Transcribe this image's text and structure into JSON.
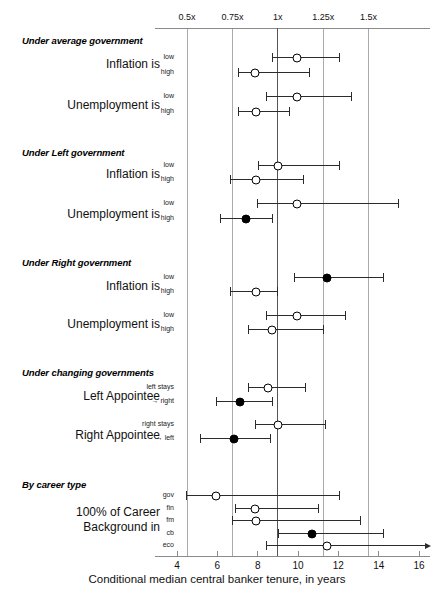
{
  "chart_data": {
    "type": "scatter",
    "title": "",
    "xlabel": "Conditional median central banker tenure, in years",
    "ylabel": "",
    "xlim": [
      3,
      16.6
    ],
    "grid": true,
    "bottom_axis": {
      "ticks": [
        4,
        6,
        8,
        10,
        12,
        14,
        16
      ],
      "tick_labels": [
        "4",
        "6",
        "8",
        "10",
        "12",
        "14",
        "16"
      ]
    },
    "top_axis": {
      "ticks": [
        4.5,
        6.75,
        9,
        11.25,
        13.5
      ],
      "tick_labels": [
        "0.5x",
        "0.75x",
        "1x",
        "1.25x",
        "1.5x"
      ],
      "reference_value": 9,
      "reference_label": "1x"
    },
    "legend": {
      "hollow_marker": "not significant",
      "filled_marker": "significant"
    },
    "groups": [
      {
        "title": "Under average government",
        "rows": [
          {
            "label": "Inflation is",
            "sublabels": [
              "low",
              "high"
            ],
            "estimates": [
              {
                "sub": "low",
                "value": 9.95,
                "low": 8.73,
                "high": 12.01,
                "filled": false,
                "right_truncated": false
              },
              {
                "sub": "high",
                "value": 7.87,
                "low": 7.02,
                "high": 10.55,
                "filled": false,
                "right_truncated": false
              }
            ]
          },
          {
            "label": "Unemployment is",
            "sublabels": [
              "low",
              "high"
            ],
            "estimates": [
              {
                "sub": "low",
                "value": 9.95,
                "low": 8.43,
                "high": 12.65,
                "filled": false,
                "right_truncated": false
              },
              {
                "sub": "high",
                "value": 7.92,
                "low": 7.02,
                "high": 9.55,
                "filled": false,
                "right_truncated": false
              }
            ]
          }
        ]
      },
      {
        "title": "Under Left government",
        "rows": [
          {
            "label": "Inflation is",
            "sublabels": [
              "low",
              "high"
            ],
            "estimates": [
              {
                "sub": "low",
                "value": 9.0,
                "low": 8.04,
                "high": 12.01,
                "filled": false,
                "right_truncated": false
              },
              {
                "sub": "high",
                "value": 7.92,
                "low": 6.63,
                "high": 10.25,
                "filled": false,
                "right_truncated": false
              }
            ]
          },
          {
            "label": "Unemployment is",
            "sublabels": [
              "low",
              "high"
            ],
            "estimates": [
              {
                "sub": "low",
                "value": 9.95,
                "low": 7.99,
                "high": 14.98,
                "filled": false,
                "right_truncated": false
              },
              {
                "sub": "high",
                "value": 7.43,
                "low": 6.14,
                "high": 8.73,
                "filled": true,
                "right_truncated": false
              }
            ]
          }
        ]
      },
      {
        "title": "Under Right government",
        "rows": [
          {
            "label": "Inflation is",
            "sublabels": [
              "low",
              "high"
            ],
            "estimates": [
              {
                "sub": "low",
                "value": 11.44,
                "low": 9.78,
                "high": 14.19,
                "filled": true,
                "right_truncated": false
              },
              {
                "sub": "high",
                "value": 7.92,
                "low": 6.63,
                "high": 8.97,
                "filled": false,
                "right_truncated": false
              }
            ]
          },
          {
            "label": "Unemployment is",
            "sublabels": [
              "low",
              "high"
            ],
            "estimates": [
              {
                "sub": "low",
                "value": 9.95,
                "low": 8.43,
                "high": 12.35,
                "filled": false,
                "right_truncated": false
              },
              {
                "sub": "high",
                "value": 8.73,
                "low": 7.53,
                "high": 11.26,
                "filled": false,
                "right_truncated": false
              }
            ]
          }
        ]
      },
      {
        "title": "Under changing governments",
        "rows": [
          {
            "label": "Left Appointee",
            "sublabels": [
              "left stays",
              "→ right"
            ],
            "estimates": [
              {
                "sub": "left stays",
                "value": 8.53,
                "low": 7.53,
                "high": 10.35,
                "filled": false,
                "right_truncated": false
              },
              {
                "sub": "→ right",
                "value": 7.14,
                "low": 5.94,
                "high": 8.73,
                "filled": true,
                "right_truncated": false
              }
            ]
          },
          {
            "label": "Right Appointee",
            "sublabels": [
              "right stays",
              "→ left"
            ],
            "estimates": [
              {
                "sub": "right stays",
                "value": 9.0,
                "low": 7.87,
                "high": 11.36,
                "filled": false,
                "right_truncated": false
              },
              {
                "sub": "→ left",
                "value": 6.83,
                "low": 5.15,
                "high": 8.63,
                "filled": true,
                "right_truncated": false
              }
            ]
          }
        ]
      },
      {
        "title": "By career type",
        "rows": [
          {
            "label": "100% of Career",
            "label2": "Background in",
            "sublabels": [
              "gov",
              "fin",
              "fm",
              "cb",
              "eco"
            ],
            "estimates": [
              {
                "sub": "gov",
                "value": 5.94,
                "low": 4.45,
                "high": 12.01,
                "filled": false,
                "right_truncated": false
              },
              {
                "sub": "fin",
                "value": 7.87,
                "low": 6.88,
                "high": 11.01,
                "filled": false,
                "right_truncated": false
              },
              {
                "sub": "fm",
                "value": 7.92,
                "low": 6.73,
                "high": 13.09,
                "filled": false,
                "right_truncated": false
              },
              {
                "sub": "cb",
                "value": 10.7,
                "low": 9.0,
                "high": 14.19,
                "filled": true,
                "right_truncated": false
              },
              {
                "sub": "eco",
                "value": 11.44,
                "low": 8.43,
                "high": 16.6,
                "filled": false,
                "right_truncated": true
              }
            ]
          }
        ]
      }
    ]
  }
}
